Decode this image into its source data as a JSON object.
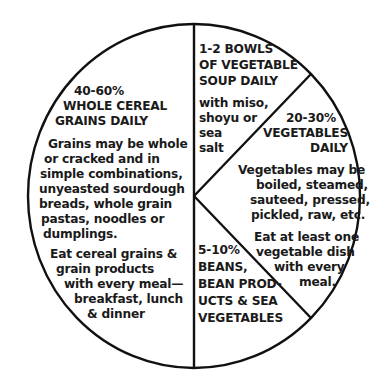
{
  "diagram": {
    "type": "pie-diagram",
    "colors": {
      "stroke": "#111111",
      "text": "#1a1a1a",
      "background": "#ffffff"
    },
    "segments": [
      {
        "id": "whole-grains",
        "share": "40-60%",
        "heading": [
          "40-60%",
          "WHOLE CEREAL",
          "GRAINS DAILY"
        ],
        "body": [
          "Grains may be whole",
          "or cracked and in",
          "simple combinations,",
          "unyeasted sourdough",
          "breads, whole grain",
          "pastas, noodles or",
          "dumplings."
        ],
        "note": [
          "Eat cereal grains &",
          "grain products",
          "with every meal—",
          "breakfast, lunch",
          "& dinner"
        ]
      },
      {
        "id": "soup",
        "share": "1-2 bowls",
        "heading": [
          "1-2 BOWLS",
          "OF VEGETABLE",
          "SOUP DAILY"
        ],
        "body": [
          "with miso,",
          "shoyu or",
          "sea",
          "salt"
        ]
      },
      {
        "id": "vegetables",
        "share": "20-30%",
        "heading": [
          "20-30%",
          "VEGETABLES",
          "DAILY"
        ],
        "body": [
          "Vegetables may be",
          "boiled, steamed,",
          "sauteed, pressed,",
          "pickled, raw, etc."
        ],
        "note": [
          "Eat at least one",
          "vegetable dish",
          "with every",
          "meal."
        ]
      },
      {
        "id": "beans",
        "share": "5-10%",
        "heading": [
          "5-10%",
          "BEANS,",
          "BEAN PROD-",
          "UCTS & SEA",
          "VEGETABLES"
        ]
      }
    ]
  }
}
